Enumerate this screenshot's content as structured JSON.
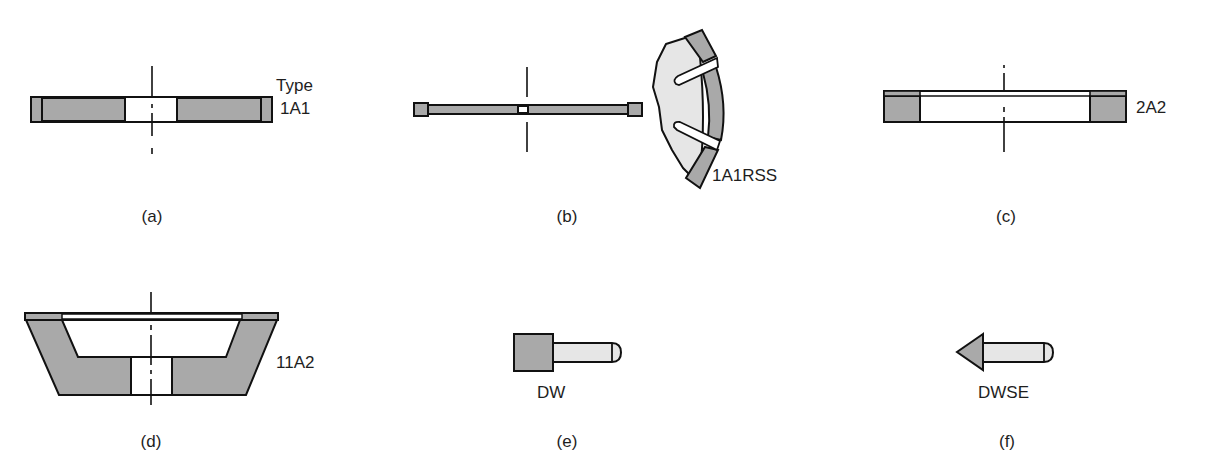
{
  "figure": {
    "colors": {
      "abrasive_fill": "#a9a9a9",
      "body_fill": "#e6e6e6",
      "outline": "#111111",
      "background": "#ffffff"
    },
    "panels": [
      {
        "id": "a",
        "caption": "(a)",
        "type_label_line1": "Type",
        "type_label_line2": "1A1",
        "shape": "straight wheel (plain disk with rim abrasive)"
      },
      {
        "id": "b",
        "caption": "(b)",
        "type_label": "1A1RSS",
        "shape": "thin slitting wheel with segmented rim"
      },
      {
        "id": "c",
        "caption": "(c)",
        "type_label": "2A2",
        "shape": "cylinder wheel"
      },
      {
        "id": "d",
        "caption": "(d)",
        "type_label": "11A2",
        "shape": "flaring cup wheel"
      },
      {
        "id": "e",
        "caption": "(e)",
        "type_label": "DW",
        "shape": "mounted point"
      },
      {
        "id": "f",
        "caption": "(f)",
        "type_label": "DWSE",
        "shape": "mounted point with conical end"
      }
    ]
  }
}
